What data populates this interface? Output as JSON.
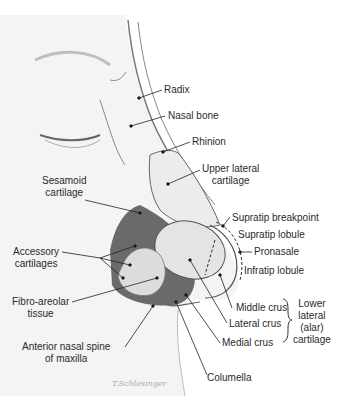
{
  "diagram": {
    "labels": {
      "radix": "Radix",
      "nasal_bone": "Nasal bone",
      "rhinion": "Rhinion",
      "upper_lateral_1": "Upper lateral",
      "upper_lateral_2": "cartilage",
      "sesamoid_1": "Sesamoid",
      "sesamoid_2": "cartilage",
      "supratip_breakpoint": "Supratip breakpoint",
      "supratip_lobule": "Supratip lobule",
      "pronasale": "Pronasale",
      "infratip_lobule": "Infratip lobule",
      "accessory_1": "Accessory",
      "accessory_2": "cartilages",
      "fibro_1": "Fibro-areolar",
      "fibro_2": "tissue",
      "middle_crus": "Middle crus",
      "lateral_crus": "Lateral crus",
      "medial_crus": "Medial crus",
      "lower_lateral_1": "Lower",
      "lower_lateral_2": "lateral",
      "lower_lateral_3": "(alar)",
      "lower_lateral_4": "cartilage",
      "ans_1": "Anterior nasal spine",
      "ans_2": "of maxilla",
      "columella": "Columella"
    },
    "signature": "T.Schlesinger"
  }
}
